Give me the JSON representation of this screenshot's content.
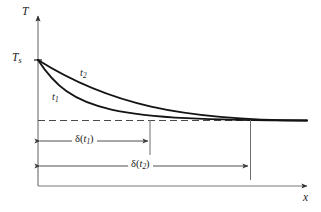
{
  "figure": {
    "background_color": "#ffffff",
    "line_color": "#1a1a1a",
    "axis_color": "#6b6b6b",
    "curve_color": "#141414",
    "width": 321,
    "height": 212
  },
  "axes": {
    "y_label": "T",
    "x_label": "x",
    "y_axis": {
      "x": 38,
      "top": 16,
      "bottom": 186
    },
    "x_axis": {
      "y": 186,
      "left": 38,
      "right": 307
    }
  },
  "markers": {
    "surface_temperature_label": "T",
    "surface_temperature_sub": "s",
    "surface_temperature_y": 60,
    "freestream_dashed_line_y": 120
  },
  "curves": [
    {
      "name": "curve-t1",
      "label": "t",
      "label_sub": "1",
      "start": {
        "x": 38,
        "y": 60
      },
      "end": {
        "x": 307,
        "y": 120
      },
      "control1": {
        "x": 72,
        "y": 112
      },
      "control2": {
        "x": 110,
        "y": 120
      },
      "boundary_layer_edge_x": 150
    },
    {
      "name": "curve-t2",
      "label": "t",
      "label_sub": "2",
      "start": {
        "x": 38,
        "y": 60
      },
      "end": {
        "x": 307,
        "y": 120
      },
      "control1": {
        "x": 108,
        "y": 104
      },
      "control2": {
        "x": 180,
        "y": 120
      },
      "boundary_layer_edge_x": 250
    }
  ],
  "dimensions": [
    {
      "name": "dimension-delta-t1",
      "symbol": "δ",
      "arg_var": "t",
      "arg_sub": "1",
      "label_text": "δ(t1)",
      "y": 141,
      "from_x": 38,
      "to_x": 150,
      "tick_x": 150,
      "tick_top": 120,
      "tick_bottom": 155
    },
    {
      "name": "dimension-delta-t2",
      "symbol": "δ",
      "arg_var": "t",
      "arg_sub": "2",
      "label_text": "δ(t2)",
      "y": 166,
      "from_x": 38,
      "to_x": 250,
      "tick_x": 250,
      "tick_top": 120,
      "tick_bottom": 180
    }
  ]
}
